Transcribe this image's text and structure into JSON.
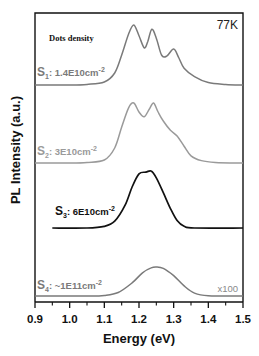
{
  "chart_data": {
    "type": "line",
    "title": "",
    "xlabel": "Energy (eV)",
    "ylabel": "PL Intensity (a.u.)",
    "xlim": [
      0.9,
      1.5
    ],
    "xticks": [
      "0.9",
      "1.0",
      "1.1",
      "1.2",
      "1.3",
      "1.4",
      "1.5"
    ],
    "xtick_values": [
      0.9,
      1.0,
      1.1,
      1.2,
      1.3,
      1.4,
      1.5
    ],
    "grid": false,
    "annotations": {
      "temperature": "77K",
      "legend_title": "Dots density",
      "scale_note": "x100"
    },
    "series": [
      {
        "name": "S1: 1.4E10cm-2",
        "label_main": "S",
        "label_sub": "1",
        "label_text": ": 1.4E10cm",
        "label_sup": "-2",
        "color": "#7a7a7a",
        "offset_baseline_px": 85,
        "points": [
          [
            0.9,
            0.0
          ],
          [
            1.0,
            0.0
          ],
          [
            1.05,
            0.01
          ],
          [
            1.1,
            0.05
          ],
          [
            1.13,
            0.2
          ],
          [
            1.15,
            0.5
          ],
          [
            1.17,
            0.85
          ],
          [
            1.185,
            1.0
          ],
          [
            1.2,
            0.82
          ],
          [
            1.215,
            0.62
          ],
          [
            1.225,
            0.72
          ],
          [
            1.237,
            0.93
          ],
          [
            1.25,
            0.78
          ],
          [
            1.265,
            0.5
          ],
          [
            1.28,
            0.48
          ],
          [
            1.3,
            0.6
          ],
          [
            1.315,
            0.45
          ],
          [
            1.33,
            0.28
          ],
          [
            1.36,
            0.14
          ],
          [
            1.4,
            0.04
          ],
          [
            1.45,
            0.01
          ],
          [
            1.5,
            0.0
          ]
        ]
      },
      {
        "name": "S2: 3E10cm-2",
        "label_main": "S",
        "label_sub": "2",
        "label_text": ": 3E10cm",
        "label_sup": "-2",
        "color": "#9a9a9a",
        "offset_baseline_px": 163,
        "points": [
          [
            0.9,
            0.0
          ],
          [
            1.0,
            0.0
          ],
          [
            1.05,
            0.01
          ],
          [
            1.1,
            0.05
          ],
          [
            1.13,
            0.25
          ],
          [
            1.15,
            0.6
          ],
          [
            1.17,
            0.92
          ],
          [
            1.185,
            1.0
          ],
          [
            1.2,
            0.85
          ],
          [
            1.215,
            0.77
          ],
          [
            1.23,
            0.9
          ],
          [
            1.242,
            1.0
          ],
          [
            1.255,
            0.85
          ],
          [
            1.27,
            0.7
          ],
          [
            1.29,
            0.55
          ],
          [
            1.31,
            0.45
          ],
          [
            1.33,
            0.28
          ],
          [
            1.35,
            0.12
          ],
          [
            1.38,
            0.04
          ],
          [
            1.42,
            0.01
          ],
          [
            1.5,
            0.0
          ]
        ]
      },
      {
        "name": "S3: 6E10cm-2",
        "label_main": "S",
        "label_sub": "3",
        "label_text": ": 6E10cm",
        "label_sup": "-2",
        "color": "#111111",
        "offset_baseline_px": 228,
        "points": [
          [
            0.95,
            0.0
          ],
          [
            1.05,
            0.0
          ],
          [
            1.1,
            0.03
          ],
          [
            1.13,
            0.12
          ],
          [
            1.16,
            0.4
          ],
          [
            1.18,
            0.72
          ],
          [
            1.2,
            0.95
          ],
          [
            1.22,
            0.98
          ],
          [
            1.235,
            1.0
          ],
          [
            1.25,
            0.88
          ],
          [
            1.27,
            0.62
          ],
          [
            1.29,
            0.35
          ],
          [
            1.31,
            0.13
          ],
          [
            1.33,
            0.03
          ],
          [
            1.36,
            0.0
          ],
          [
            1.5,
            0.0
          ]
        ]
      },
      {
        "name": "S4: ~1E11cm-2",
        "label_main": "S",
        "label_sub": "4",
        "label_text": ": ~1E11cm",
        "label_sup": "-2",
        "color": "#7a7a7a",
        "offset_baseline_px": 296,
        "points": [
          [
            0.9,
            0.0
          ],
          [
            1.05,
            0.0
          ],
          [
            1.1,
            0.02
          ],
          [
            1.14,
            0.12
          ],
          [
            1.18,
            0.45
          ],
          [
            1.21,
            0.8
          ],
          [
            1.235,
            0.97
          ],
          [
            1.25,
            1.0
          ],
          [
            1.27,
            0.95
          ],
          [
            1.3,
            0.7
          ],
          [
            1.33,
            0.35
          ],
          [
            1.36,
            0.1
          ],
          [
            1.4,
            0.01
          ],
          [
            1.5,
            0.0
          ]
        ]
      }
    ],
    "peak_heights_px": [
      60,
      60,
      57,
      29
    ]
  }
}
